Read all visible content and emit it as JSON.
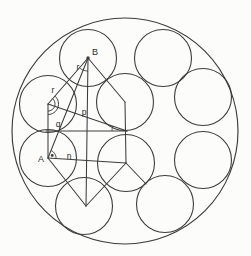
{
  "figure": {
    "canvas": {
      "width": 251,
      "height": 256,
      "background": "#fcfcfb"
    },
    "stroke_color": "#3c3c3c",
    "label_color": "#2b2b2b",
    "outer_circle": {
      "cx": 125,
      "cy": 131,
      "r": 113
    },
    "small_circle_radius": 28.5,
    "small_circles": [
      {
        "name": "circle-top-left-B",
        "cx": 88,
        "cy": 58
      },
      {
        "name": "circle-top-right",
        "cx": 163,
        "cy": 58
      },
      {
        "name": "circle-right-upper",
        "cx": 203,
        "cy": 97
      },
      {
        "name": "circle-right-lower",
        "cx": 203,
        "cy": 160
      },
      {
        "name": "circle-bottom-right",
        "cx": 165,
        "cy": 204
      },
      {
        "name": "circle-bottom-left",
        "cx": 84,
        "cy": 206
      },
      {
        "name": "circle-left-lower-A",
        "cx": 48,
        "cy": 158
      },
      {
        "name": "circle-left-upper",
        "cx": 48,
        "cy": 104
      },
      {
        "name": "circle-center-upper",
        "cx": 125,
        "cy": 102
      },
      {
        "name": "circle-center-lower",
        "cx": 126,
        "cy": 163
      }
    ],
    "segments": [
      {
        "name": "segment-B-to-left-upper-center",
        "x1": 88,
        "y1": 58,
        "x2": 48,
        "y2": 104
      },
      {
        "name": "segment-left-upper-center-to-A",
        "x1": 48,
        "y1": 104,
        "x2": 48,
        "y2": 158
      },
      {
        "name": "segment-A-to-bottom-left-center",
        "x1": 48,
        "y1": 158,
        "x2": 86,
        "y2": 206
      },
      {
        "name": "segment-bottom-left-center-to-center-lower",
        "x1": 86,
        "y1": 206,
        "x2": 126,
        "y2": 163
      },
      {
        "name": "segment-center-lower-to-center-upper",
        "x1": 126,
        "y1": 163,
        "x2": 125,
        "y2": 102
      },
      {
        "name": "segment-center-upper-to-B",
        "x1": 125,
        "y1": 102,
        "x2": 88,
        "y2": 58
      },
      {
        "name": "segment-A-to-B",
        "x1": 48,
        "y1": 158,
        "x2": 88,
        "y2": 58
      },
      {
        "name": "segment-B-vertical",
        "x1": 88,
        "y1": 58,
        "x2": 86,
        "y2": 206
      },
      {
        "name": "segment-n-line-A-to-center-lower",
        "x1": 48,
        "y1": 158,
        "x2": 126,
        "y2": 163
      },
      {
        "name": "segment-horizontal-to-big-center",
        "x1": 46,
        "y1": 131,
        "x2": 127,
        "y2": 131
      },
      {
        "name": "segment-p-line-left-upper-to-big-center",
        "x1": 48,
        "y1": 104,
        "x2": 127,
        "y2": 131
      },
      {
        "name": "segment-center-lower-to-bottom-right",
        "x1": 126,
        "y1": 163,
        "x2": 146,
        "y2": 184
      }
    ],
    "angle_marks": [
      {
        "name": "angle-arc-at-B",
        "cx": 88,
        "cy": 58,
        "r": 13,
        "a1": 90,
        "a2": 131
      },
      {
        "name": "angle-arc-at-left-upper-inner",
        "cx": 48,
        "cy": 104,
        "r": 7,
        "a1": -49,
        "a2": 90
      },
      {
        "name": "angle-arc-at-left-upper-outer",
        "cx": 48,
        "cy": 104,
        "r": 10.5,
        "a1": -49,
        "a2": 90
      },
      {
        "name": "angle-arc-at-A",
        "cx": 48,
        "cy": 158,
        "r": 8,
        "a1": -68,
        "a2": 4
      },
      {
        "name": "angle-arc-at-big-center",
        "cx": 127,
        "cy": 131,
        "r": 15,
        "a1": 180,
        "a2": 199
      }
    ],
    "dots": [
      {
        "name": "vertex-dot-B",
        "cx": 88,
        "cy": 58,
        "r": 1.7
      },
      {
        "name": "angle-dot-A",
        "cx": 52.2,
        "cy": 155.4,
        "r": 1.4
      }
    ],
    "labels": [
      {
        "name": "label-B",
        "text": "B",
        "x": 95,
        "y": 55,
        "size": 9
      },
      {
        "name": "label-r-upper",
        "text": "r",
        "x": 78,
        "y": 70,
        "size": 8.5
      },
      {
        "name": "label-r-lower",
        "text": "r",
        "x": 53,
        "y": 93,
        "size": 8.5
      },
      {
        "name": "label-p",
        "text": "p",
        "x": 84,
        "y": 115,
        "size": 8.5
      },
      {
        "name": "label-q",
        "text": "q",
        "x": 58,
        "y": 127,
        "size": 8.5
      },
      {
        "name": "label-A",
        "text": "A",
        "x": 41,
        "y": 162,
        "size": 9
      },
      {
        "name": "label-n",
        "text": "n",
        "x": 69,
        "y": 159,
        "size": 8.5
      }
    ]
  }
}
